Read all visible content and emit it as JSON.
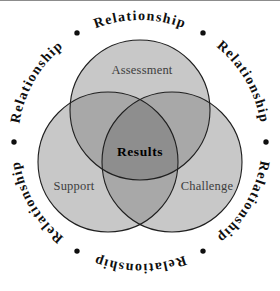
{
  "colors": {
    "top_rule": "#8c8c8c",
    "region_single": "#c8c8c8",
    "region_double": "#a8a8a8",
    "region_triple": "#8e8e8e",
    "circle_outline": "#1f1f1f",
    "zone_label_text": "#3d3d3d",
    "center_label_text": "#000000",
    "ring_text": "#0f0f0f"
  },
  "diagram": {
    "ring_word": "Relationship",
    "ring_bullet_icon": "•",
    "circle_labels": {
      "top": "Assessment",
      "bottom_left": "Support",
      "bottom_right": "Challenge"
    },
    "center_label": "Results"
  }
}
